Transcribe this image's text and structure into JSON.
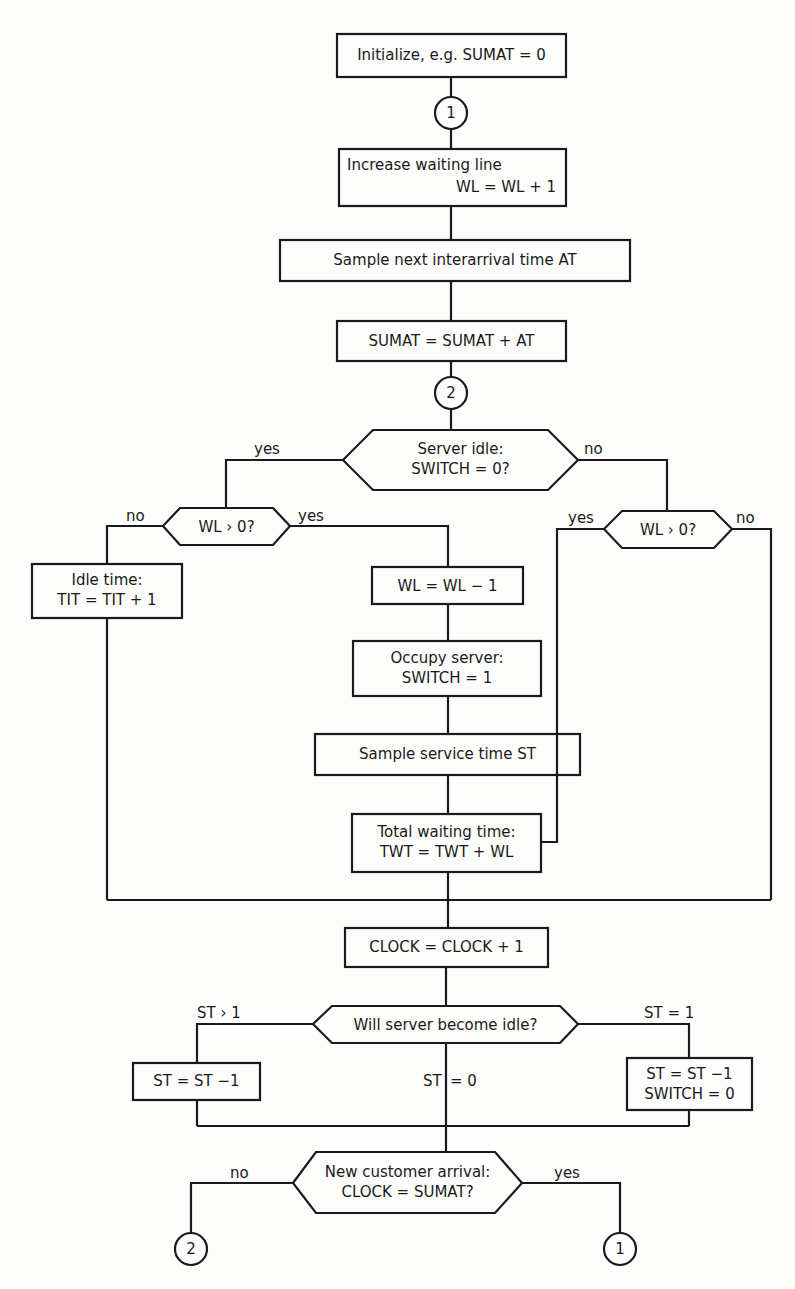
{
  "diagram": {
    "type": "flowchart",
    "nodes": {
      "init": {
        "text": "Initialize, e.g. SUMAT = 0"
      },
      "connector1_top": {
        "text": "1"
      },
      "increase_wl": {
        "line1": "Increase waiting line",
        "line2": "WL = WL + 1"
      },
      "sample_at": {
        "text": "Sample next interarrival time  AT"
      },
      "sumat": {
        "text": "SUMAT = SUMAT + AT"
      },
      "connector2_top": {
        "text": "2"
      },
      "server_idle": {
        "line1": "Server idle:",
        "line2": "SWITCH = 0?"
      },
      "wl_gt0_left": {
        "text": "WL › 0?"
      },
      "idle_time": {
        "line1": "Idle time:",
        "line2": "TIT  =  TIT + 1"
      },
      "wl_minus": {
        "text": "WL = WL  − 1"
      },
      "occupy": {
        "line1": "Occupy server:",
        "line2": "SWITCH = 1"
      },
      "sample_st": {
        "text": "Sample service time  ST"
      },
      "total_wait": {
        "line1": "Total waiting time:",
        "line2": "TWT  = TWT + WL"
      },
      "wl_gt0_right": {
        "text": "WL › 0?"
      },
      "clock": {
        "text": "CLOCK = CLOCK + 1"
      },
      "will_idle": {
        "text": "Will  server  become idle?"
      },
      "st_minus_left": {
        "text": "ST = ST −1"
      },
      "st_minus_right": {
        "line1": "ST = ST −1",
        "line2": "SWITCH = 0"
      },
      "new_customer": {
        "line1": "New customer arrival:",
        "line2": "CLOCK = SUMAT?"
      },
      "connector2_bottom": {
        "text": "2"
      },
      "connector1_bottom": {
        "text": "1"
      }
    },
    "edge_labels": {
      "server_idle_yes": "yes",
      "server_idle_no": "no",
      "wl_left_no": "no",
      "wl_left_yes": "yes",
      "wl_right_yes": "yes",
      "wl_right_no": "no",
      "st_gt1": "ST › 1",
      "st_eq1": "ST = 1",
      "st_eq0_a": "ST",
      "st_eq0_b": "= 0",
      "new_no": "no",
      "new_yes": "yes"
    },
    "colors": {
      "ink": "#1a1a1a",
      "paper": "#fdfdfc"
    }
  }
}
